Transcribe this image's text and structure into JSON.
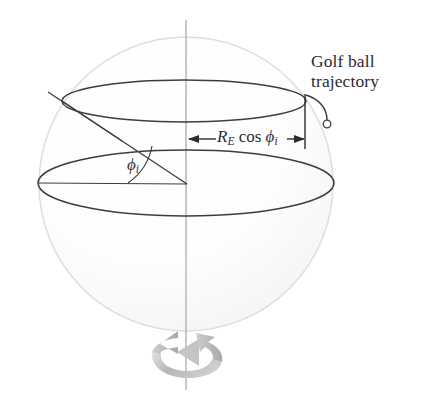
{
  "figure": {
    "kind": "physics-diagram",
    "background_color": "#ffffff",
    "sphere": {
      "name": "earth-sphere",
      "center_x": 186,
      "center_y": 184,
      "radius": 147,
      "outline_color": "#d8d8dc",
      "fill_color": "#fcfcfd"
    },
    "axis": {
      "name": "rotation-axis",
      "x": 186,
      "y_top": 20,
      "y_bottom": 390,
      "color": "#b9b9c0"
    },
    "equator": {
      "name": "equator-ellipse",
      "cx": 186,
      "cy": 183,
      "rx": 148,
      "ry": 33,
      "color": "#3a3a42"
    },
    "latitude_circle": {
      "name": "latitude-circle",
      "cx": 184,
      "cy": 101,
      "rx": 122,
      "ry": 21,
      "color": "#3a3a42"
    },
    "radius_lines": {
      "equatorial_radius": {
        "name": "equatorial-radius-line",
        "x1": 38,
        "y1": 183,
        "x2": 186,
        "y2": 184
      },
      "tilted_radius": {
        "name": "tilted-radius-line",
        "x1": 48,
        "y1": 92,
        "x2": 186,
        "y2": 184
      },
      "extension": {
        "name": "radius-extension-line",
        "x1": 48,
        "y1": 92,
        "x2": 115,
        "y2": 137
      }
    },
    "angle_arc": {
      "name": "phi-angle-arc",
      "radius": 58,
      "color": "#3a3a42"
    },
    "dimension": {
      "name": "radius-dimension-arrow",
      "y": 139,
      "x_left": 188,
      "x_right": 305,
      "tick_x": 305,
      "tick_y_top": 95,
      "tick_y_bottom": 148,
      "color": "#2b2b33"
    },
    "trajectory": {
      "name": "golf-ball-trajectory-curve",
      "start_x": 306,
      "start_y": 96,
      "ball_x": 328,
      "ball_y": 124,
      "ball_radius": 4,
      "color": "#3a3a42"
    },
    "rotation_arrow": {
      "name": "rotation-direction-arrow",
      "cx": 188,
      "cy": 362,
      "color_light": "#d5d5d5",
      "color_dark": "#9a9a9a",
      "direction": "counterclockwise-viewed-from-above"
    }
  },
  "labels": {
    "golf_ball_line1": "Golf ball",
    "golf_ball_line2": "trajectory",
    "dimension_symbol_R": "R",
    "dimension_subscript_E": "E",
    "dimension_cos": "cos",
    "dimension_symbol_phi": "ϕ",
    "dimension_subscript_i": "i",
    "angle_symbol_phi": "ϕ",
    "angle_subscript_i": "i"
  }
}
